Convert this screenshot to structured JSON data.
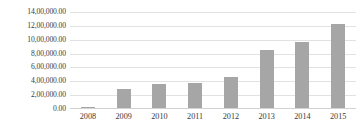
{
  "chart_data": {
    "type": "bar",
    "title": "",
    "subtitle": "",
    "xlabel": "",
    "ylabel": "",
    "categories": [
      "2008",
      "2009",
      "2010",
      "2011",
      "2012",
      "2013",
      "2014",
      "2015"
    ],
    "values": [
      20000,
      280000,
      350000,
      370000,
      450000,
      840000,
      970000,
      1230000
    ],
    "series": [
      {
        "name": "",
        "values": [
          20000,
          280000,
          350000,
          370000,
          450000,
          840000,
          970000,
          1230000
        ]
      }
    ],
    "ylim": [
      0,
      1400000
    ],
    "ytick_values": [
      0,
      200000,
      400000,
      600000,
      800000,
      1000000,
      1200000,
      1400000
    ],
    "ytick_labels": [
      "0.00",
      "2,00,000.00",
      "4,00,000.00",
      "6,00,000.00",
      "8,00,000.00",
      "10,00,000.00",
      "12,00,000.00",
      "14,00,000.00"
    ],
    "xtick_labels": [
      "2008",
      "2009",
      "2010",
      "2011",
      "2012",
      "2013",
      "2014",
      "2015"
    ],
    "grid": true,
    "legend": false,
    "legend_position": "none",
    "annotations": [],
    "colors": {
      "bar": "#a6a6a6",
      "gridline": "#e2e2e2",
      "axis": "#d2d2d2",
      "text": "#3b3b3b",
      "background": "#ffffff"
    }
  }
}
